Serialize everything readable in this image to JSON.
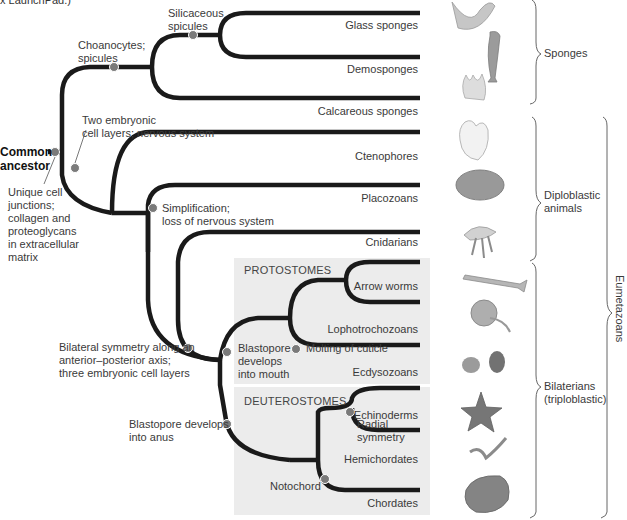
{
  "caption_fragment": "x LaunchPad.)",
  "root": {
    "label_line1": "Common",
    "label_line2": "ancestor"
  },
  "characters": {
    "unique_junctions": [
      "Unique cell",
      "junctions;",
      "collagen and",
      "proteoglycans",
      "in extracellular",
      "matrix"
    ],
    "choanocytes": [
      "Choanocytes;",
      "spicules"
    ],
    "silicaceous": [
      "Silicaceous",
      "spicules"
    ],
    "two_layers": [
      "Two embryonic",
      "cell layers; nervous system"
    ],
    "simplification": [
      "Simplification;",
      "loss of nervous system"
    ],
    "bilateral": [
      "Bilateral symmetry along an",
      "anterior–posterior axis;",
      "three embryonic cell layers"
    ],
    "blastopore_mouth": [
      "Blastopore",
      "develops",
      "into mouth"
    ],
    "molting": "Molting of cuticle",
    "blastopore_anus": [
      "Blastopore develops",
      "into anus"
    ],
    "radial": [
      "Radial",
      "symmetry"
    ],
    "notochord": "Notochord"
  },
  "boxes": {
    "protostomes": "PROTOSTOMES",
    "deuterostomes": "DEUTEROSTOMES"
  },
  "taxa": [
    {
      "name": "Glass sponges",
      "icon": "glass-sponge-illustration"
    },
    {
      "name": "Demosponges",
      "icon": "demosponge-illustration"
    },
    {
      "name": "Calcareous sponges",
      "icon": "calcareous-sponge-illustration"
    },
    {
      "name": "Ctenophores",
      "icon": "ctenophore-illustration"
    },
    {
      "name": "Placozoans",
      "icon": "placozoan-illustration"
    },
    {
      "name": "Cnidarians",
      "icon": "jellyfish-illustration"
    },
    {
      "name": "Arrow worms",
      "icon": "arrow-worm-illustration"
    },
    {
      "name": "Lophotrochozoans",
      "icon": "nautilus-illustration"
    },
    {
      "name": "Ecdysozoans",
      "icon": "mite-beetle-illustration"
    },
    {
      "name": "Echinoderms",
      "icon": "starfish-illustration"
    },
    {
      "name": "Hemichordates",
      "icon": "acorn-worm-illustration"
    },
    {
      "name": "Chordates",
      "icon": "frog-illustration"
    }
  ],
  "groups": {
    "sponges": "Sponges",
    "diploblastic": [
      "Diploblastic",
      "animals"
    ],
    "bilaterians": [
      "Bilaterians",
      "(triploblastic)"
    ],
    "eumetazoans": "Eumetazoans"
  },
  "colors": {
    "branch": "#1a1a1a",
    "node": "#7a7a7a",
    "box_fill": "#ececec",
    "text": "#3a3a3a"
  }
}
